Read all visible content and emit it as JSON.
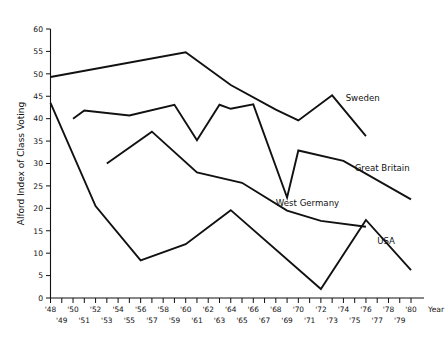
{
  "figure": {
    "caption_fragment": "",
    "year_axis_label": "Year"
  },
  "chart_data": {
    "type": "line",
    "title": "",
    "subtitle": "",
    "xlabel": "Year",
    "ylabel": "Alford Index of Class Voting",
    "xlim": [
      1948,
      1981
    ],
    "ylim": [
      0,
      60
    ],
    "ytick_step": 5,
    "grid": false,
    "legend_position": "inline-right-of-line-ends",
    "yticks": [
      0,
      5,
      10,
      15,
      20,
      25,
      30,
      35,
      40,
      45,
      50,
      55,
      60
    ],
    "ytick_labels": [
      "0",
      "5",
      "10",
      "15",
      "20",
      "25",
      "30",
      "35",
      "40",
      "45",
      "50",
      "55",
      "60"
    ],
    "xticks": [
      1948,
      1949,
      1950,
      1951,
      1952,
      1953,
      1954,
      1955,
      1956,
      1957,
      1958,
      1959,
      1960,
      1961,
      1962,
      1963,
      1964,
      1965,
      1966,
      1967,
      1968,
      1969,
      1970,
      1971,
      1972,
      1973,
      1974,
      1975,
      1976,
      1977,
      1978,
      1979,
      1980
    ],
    "xtick_labels_upper": [
      "'48",
      "'50",
      "'52",
      "'54",
      "'56",
      "'58",
      "'60",
      "'62",
      "'64",
      "'66",
      "'68",
      "'70",
      "'72",
      "'74",
      "'76",
      "'78",
      "'80"
    ],
    "xtick_years_upper": [
      1948,
      1950,
      1952,
      1954,
      1956,
      1958,
      1960,
      1962,
      1964,
      1966,
      1968,
      1970,
      1972,
      1974,
      1976,
      1978,
      1980
    ],
    "xtick_labels_lower": [
      "'49",
      "'51",
      "'53",
      "'55",
      "'57",
      "'59",
      "'61",
      "'63",
      "'65",
      "'67",
      "'69",
      "'71",
      "'73",
      "'75",
      "'77",
      "'79"
    ],
    "xtick_years_lower": [
      1949,
      1951,
      1953,
      1955,
      1957,
      1959,
      1961,
      1963,
      1965,
      1967,
      1969,
      1971,
      1973,
      1975,
      1977,
      1979
    ],
    "series": [
      {
        "name": "Sweden",
        "label": "Sweden",
        "color": "#111111",
        "label_year": 1974.2,
        "label_value": 44.0,
        "x": [
          1948,
          1960,
          1964,
          1968,
          1970,
          1973,
          1976
        ],
        "values": [
          49.3,
          54.8,
          47.5,
          42.0,
          39.6,
          45.2,
          36.1
        ]
      },
      {
        "name": "Great Britain",
        "label": "Great Britain",
        "color": "#111111",
        "label_year": 1975.0,
        "label_value": 28.4,
        "x": [
          1950,
          1951,
          1955,
          1959,
          1961,
          1963,
          1964,
          1966,
          1969,
          1970,
          1974,
          1980
        ],
        "values": [
          40.0,
          41.8,
          40.7,
          43.1,
          35.2,
          43.1,
          42.2,
          43.2,
          22.4,
          32.9,
          30.6,
          22.0
        ]
      },
      {
        "name": "West Germany",
        "label": "West Germany",
        "color": "#111111",
        "label_year": 1968.0,
        "label_value": 20.6,
        "x": [
          1953,
          1957,
          1961,
          1965,
          1969,
          1972,
          1976
        ],
        "values": [
          30.0,
          37.1,
          28.0,
          25.7,
          19.5,
          17.2,
          15.9
        ]
      },
      {
        "name": "USA",
        "label": "USA",
        "color": "#111111",
        "label_year": 1977.0,
        "label_value": 12.0,
        "x": [
          1948,
          1952,
          1956,
          1960,
          1964,
          1972,
          1976,
          1980
        ],
        "values": [
          43.5,
          20.5,
          8.4,
          12.0,
          19.6,
          2.0,
          17.4,
          6.2
        ]
      }
    ]
  }
}
